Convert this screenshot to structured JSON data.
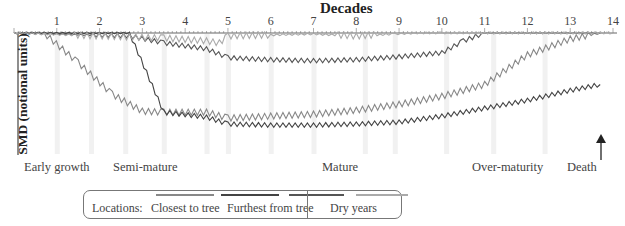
{
  "title": "Decades",
  "ylabel": "SMD (notional units)",
  "x_ticks": [
    "1",
    "2",
    "3",
    "4",
    "5",
    "6",
    "7",
    "8",
    "9",
    "10",
    "11",
    "12",
    "13",
    "14"
  ],
  "stages": [
    {
      "label": "Early growth",
      "x": 24
    },
    {
      "label": "Semi-mature",
      "x": 113
    },
    {
      "label": "Mature",
      "x": 322
    },
    {
      "label": "Over-maturity",
      "x": 472
    },
    {
      "label": "Death",
      "x": 567
    }
  ],
  "legend": {
    "locations_label": "Locations:",
    "closest_label": "Closest to tree",
    "furthest_label": "Furthest from tree",
    "dry_years_label": "Dry years",
    "series_colors": [
      "#888888",
      "#444444",
      "#555555",
      "#aaaaaa"
    ]
  },
  "chart_data": {
    "type": "line",
    "title": "Decades",
    "xlabel": "Decades",
    "ylabel": "SMD (notional units)",
    "x_range": [
      0,
      14
    ],
    "x_ticks": [
      1,
      2,
      3,
      4,
      5,
      6,
      7,
      8,
      9,
      10,
      11,
      12,
      13,
      14
    ],
    "y_inverted": true,
    "y_range": [
      0,
      100
    ],
    "dry_year_bands": [
      1.0,
      1.8,
      2.6,
      3.5,
      4.5,
      5.0,
      6.0,
      7.0,
      8.2,
      8.9,
      10.1,
      11.2,
      12.4
    ],
    "annotations": [
      "Early growth",
      "Semi-mature",
      "Mature",
      "Over-maturity",
      "Death"
    ],
    "series": [
      {
        "name": "Closest to tree",
        "x": [
          0,
          0.7,
          1.5,
          2.3,
          3.0,
          3.5,
          4.5,
          5.0,
          6.0,
          7.0,
          8.0,
          9.0,
          10.0,
          11.0,
          12.0,
          13.0,
          13.7
        ],
        "values": [
          0,
          0,
          30,
          62,
          79,
          80,
          80,
          86,
          84,
          82,
          78,
          72,
          64,
          52,
          22,
          6,
          0
        ]
      },
      {
        "name": "Location 2",
        "x": [
          0,
          2.7,
          3.1,
          3.5,
          4.5,
          5.0,
          6.0,
          7.0,
          8.0,
          9.0,
          10.0,
          11.0,
          12.0,
          13.0,
          13.7
        ],
        "values": [
          0,
          0,
          40,
          80,
          85,
          92,
          93,
          93,
          92,
          90,
          84,
          76,
          68,
          58,
          52
        ]
      },
      {
        "name": "Location 3",
        "x": [
          0,
          2.7,
          3.5,
          4.5,
          5.0,
          6.0,
          7.0,
          8.0,
          9.0,
          10.0,
          10.5,
          11.0,
          12.0,
          13.7
        ],
        "values": [
          0,
          3,
          10,
          16,
          25,
          27,
          28,
          27,
          24,
          20,
          8,
          0,
          0,
          0
        ]
      },
      {
        "name": "Furthest from tree",
        "x": [
          0,
          2.7,
          3.5,
          4.5,
          4.8,
          5.0,
          6.0,
          7.0,
          8.0,
          8.9,
          9.5,
          10.0,
          14.0
        ],
        "values": [
          0,
          4,
          5,
          8,
          10,
          3,
          2,
          1,
          3,
          1,
          0,
          0,
          0
        ]
      }
    ],
    "legend_position": "bottom"
  }
}
